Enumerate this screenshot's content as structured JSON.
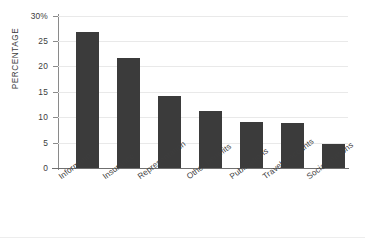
{
  "chart_data": {
    "type": "bar",
    "title": "",
    "subtitle": "",
    "xlabel": "",
    "ylabel": "PERCENTAGE",
    "categories": [
      "Information",
      "Insurance",
      "Representation",
      "Other benefits",
      "Publications",
      "Travel discounts",
      "Social reasons"
    ],
    "values": [
      26.9,
      21.7,
      14.2,
      11.2,
      9.1,
      8.9,
      4.7
    ],
    "ylim": [
      0,
      30
    ],
    "ytick_values": [
      0,
      5,
      10,
      15,
      20,
      25,
      30
    ],
    "ytick_labels": [
      "0",
      "5",
      "10",
      "15",
      "20",
      "25",
      "30%"
    ],
    "grid": true,
    "legend": null,
    "legend_position": "none",
    "bar_color": "#3b3b3b",
    "gridline_color": "#e9e9e9",
    "axis_color": "#6f6f6f",
    "text_color": "#3d3d3d",
    "background_color": "#ffffff"
  }
}
